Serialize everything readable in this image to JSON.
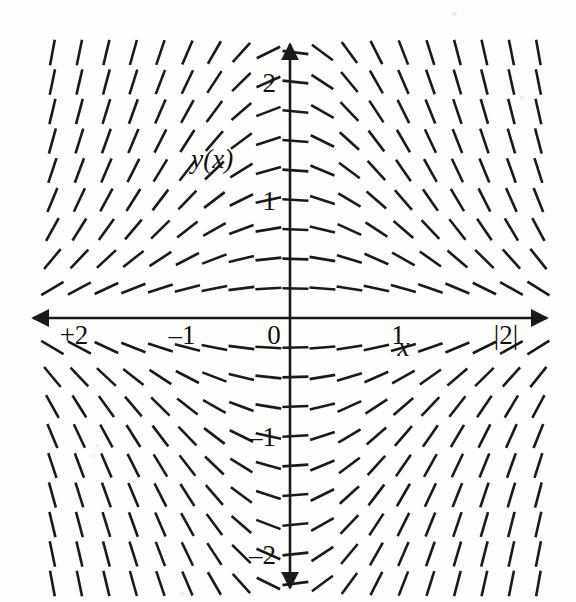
{
  "figure": {
    "title": "",
    "background_color": "#fdfdfb",
    "ink_color": "#1a1a1a",
    "width": 576,
    "height": 602
  },
  "labels": {
    "y_function_label": "y(x)",
    "x_axis_label": "x",
    "zero_label": "0"
  },
  "chart_data": {
    "type": "scatter",
    "subtype": "slope-field",
    "title": "",
    "xlabel": "x",
    "ylabel": "y(x)",
    "xlim": [
      -2.35,
      2.35
    ],
    "ylim": [
      -2.35,
      2.35
    ],
    "grid": false,
    "legend": null,
    "axes": {
      "style": "arrowed-crosshair",
      "x_axis_y_value": 0,
      "y_axis_x_value": 0,
      "x_arrow_both_ends": true,
      "y_arrow_both_ends": true
    },
    "xticks": [
      -2,
      -1,
      0,
      1,
      2
    ],
    "xticklabels": [
      "+2",
      "–1",
      "0",
      "1",
      "|2|"
    ],
    "yticks": [
      -2,
      -1,
      1,
      2
    ],
    "yticklabels": [
      "–2",
      "–1",
      "1",
      "2"
    ],
    "annotations": [
      {
        "text": "y(x)",
        "x": -0.72,
        "y": 1.27,
        "italic": true
      },
      {
        "text": "x",
        "x": 1.05,
        "y": -0.32,
        "italic": true
      }
    ],
    "field": {
      "equation": "dy/dx = -x*y",
      "description": "Direction field: segments steep/vertical far from both axes in quadrant corners toward |x| large, flattening to horizontal near the y-axis and at large |y|.",
      "x_samples": [
        -2.2,
        -1.95,
        -1.7,
        -1.45,
        -1.2,
        -0.95,
        -0.7,
        -0.45,
        -0.2,
        0.05,
        0.3,
        0.55,
        0.8,
        1.05,
        1.3,
        1.55,
        1.8,
        2.05,
        2.3
      ],
      "y_samples": [
        2.25,
        2.0,
        1.75,
        1.5,
        1.25,
        1.0,
        0.75,
        0.5,
        0.25,
        -0.25,
        -0.5,
        -0.75,
        -1.0,
        -1.25,
        -1.5,
        -1.75,
        -2.0,
        -2.25
      ],
      "segment_pixel_length": 26,
      "segment_stroke_width": 2.6,
      "slope_scale": 1.0
    }
  },
  "geometry": {
    "origin_px": {
      "x": 290,
      "y": 318
    },
    "unit_px": {
      "x": 108,
      "y": 118
    },
    "x_axis_span_px": {
      "x1": 33,
      "x2": 547
    },
    "y_axis_span_px": {
      "y1": 44,
      "y2": 588
    }
  }
}
